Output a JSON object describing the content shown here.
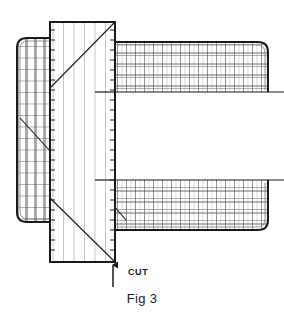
{
  "figure": {
    "caption": "Fig 3",
    "cut_label": "CUT",
    "background_color": "#ffffff",
    "ink_color": "#1a1a1a",
    "hatch_color": "#6e6e6e"
  },
  "annotations": {
    "cut_arrow": {
      "name": "cut-arrow",
      "points_to_x": 113,
      "direction": "up"
    }
  },
  "parts": {
    "center_board": {
      "label": "center-board",
      "x": 50,
      "y": 22,
      "width": 65,
      "height": 240,
      "hatch": "vertical-grain",
      "edge_ticks": "both"
    },
    "left_block": {
      "label": "left-block",
      "x": 17,
      "y": 38,
      "width": 35,
      "height": 184,
      "hatch": "grid",
      "corners": "rounded"
    },
    "upper_right_band": {
      "label": "upper-right-band",
      "x": 115,
      "y": 42,
      "width": 153,
      "height": 50,
      "hatch": "grid",
      "corners": "rounded-right"
    },
    "lower_right_band": {
      "label": "lower-right-band",
      "x": 115,
      "y": 180,
      "width": 153,
      "height": 50,
      "hatch": "grid",
      "corners": "rounded-right"
    },
    "upper_reference_line": {
      "label": "upper-reference-line",
      "y": 92,
      "x1": 95,
      "x2": 284
    },
    "lower_reference_line": {
      "label": "lower-reference-line",
      "y": 180,
      "x1": 95,
      "x2": 284
    }
  },
  "diagonals": {
    "center_top": {
      "x1": 50,
      "y1": 88,
      "x2": 115,
      "y2": 22
    },
    "center_bottom": {
      "x1": 50,
      "y1": 198,
      "x2": 115,
      "y2": 262
    },
    "left_block": {
      "x1": 20,
      "y1": 118,
      "x2": 51,
      "y2": 152
    },
    "lower_band_corner": {
      "x1": 114,
      "y1": 206,
      "x2": 126,
      "y2": 220
    }
  }
}
